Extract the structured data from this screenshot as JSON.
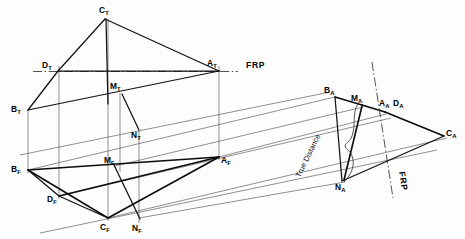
{
  "figure": {
    "background_color": "#fdfdfd",
    "line_color": "#111111",
    "projection_line_color": "#4a4a4a"
  },
  "reference_lines": [
    {
      "name": "frp-top",
      "label": "FRP",
      "label_x": 246,
      "label_y": 68,
      "x1": 33,
      "y1": 71.5,
      "x2": 238,
      "y2": 71.5
    },
    {
      "name": "frp-aux",
      "label": "FRP",
      "label_x": 399,
      "label_y": 172,
      "x1": 374,
      "y1": 64,
      "x2": 391,
      "y2": 196
    }
  ],
  "views": {
    "top": {
      "name": "top-view",
      "points": {
        "C_T": {
          "letter": "C",
          "sub": "T",
          "x": 105,
          "y": 19,
          "lx": 99,
          "ly": 13
        },
        "D_T": {
          "letter": "D",
          "sub": "T",
          "x": 58,
          "y": 71,
          "lx": 44,
          "ly": 67
        },
        "A_T": {
          "letter": "A",
          "sub": "T",
          "x": 219,
          "y": 71,
          "lx": 207,
          "ly": 65
        },
        "B_T": {
          "letter": "B",
          "sub": "T",
          "x": 28,
          "y": 110,
          "lx": 13,
          "ly": 111
        },
        "M_T": {
          "letter": "M",
          "sub": "T",
          "x": 122,
          "y": 93,
          "lx": 112,
          "ly": 88
        },
        "N_T": {
          "letter": "N",
          "sub": "T",
          "x": 138,
          "y": 133,
          "lx": 133,
          "ly": 137
        }
      }
    },
    "front": {
      "name": "front-view",
      "points": {
        "B_F": {
          "letter": "B",
          "sub": "F",
          "x": 28,
          "y": 170,
          "lx": 13,
          "ly": 171
        },
        "D_F": {
          "letter": "D",
          "sub": "F",
          "x": 59,
          "y": 196,
          "lx": 50,
          "ly": 200
        },
        "C_F": {
          "letter": "C",
          "sub": "F",
          "x": 108,
          "y": 218,
          "lx": 100,
          "ly": 228
        },
        "N_F": {
          "letter": "N",
          "sub": "F",
          "x": 138,
          "y": 221,
          "lx": 133,
          "ly": 230
        },
        "M_F": {
          "letter": "M",
          "sub": "F",
          "x": 115,
          "y": 166,
          "lx": 105,
          "ly": 162
        },
        "A_F": {
          "letter": "A",
          "sub": "F",
          "x": 219,
          "y": 157,
          "lx": 221,
          "ly": 162
        }
      }
    },
    "auxiliary": {
      "name": "auxiliary-view",
      "points": {
        "B_A": {
          "letter": "B",
          "sub": "A",
          "x": 335,
          "y": 97,
          "lx": 325,
          "ly": 92
        },
        "M_A": {
          "letter": "M",
          "sub": "A",
          "x": 362,
          "y": 105,
          "lx": 352,
          "ly": 100
        },
        "A_A": {
          "letter": "A",
          "sub": "A",
          "x": 385,
          "y": 112,
          "lx": 381,
          "ly": 105
        },
        "D_A": {
          "letter": "D",
          "sub": "A",
          "x": 385,
          "y": 112,
          "lx": 395,
          "ly": 105
        },
        "C_A": {
          "letter": "C",
          "sub": "A",
          "x": 444,
          "y": 136,
          "lx": 446,
          "ly": 134
        },
        "N_A": {
          "letter": "N",
          "sub": "A",
          "x": 342,
          "y": 181,
          "lx": 336,
          "ly": 189
        }
      },
      "annotation": {
        "name": "true-distance-annotation",
        "text": "True Distance",
        "x": 300,
        "y": 178,
        "rotation": -64
      }
    }
  },
  "geometry": {
    "top_view_edges": [
      {
        "name": "edge-CT-DT",
        "x1": 105,
        "y1": 19,
        "x2": 58,
        "y2": 71
      },
      {
        "name": "edge-CT-AT",
        "x1": 105,
        "y1": 19,
        "x2": 219,
        "y2": 71
      },
      {
        "name": "edge-CT-MT-ext",
        "x1": 105,
        "y1": 19,
        "x2": 108,
        "y2": 100
      },
      {
        "name": "edge-DT-BT",
        "x1": 58,
        "y1": 71,
        "x2": 28,
        "y2": 110
      },
      {
        "name": "edge-DT-AT",
        "x1": 58,
        "y1": 71,
        "x2": 219,
        "y2": 71
      },
      {
        "name": "edge-BT-AT",
        "x1": 28,
        "y1": 110,
        "x2": 219,
        "y2": 71
      },
      {
        "name": "edge-MT-NT",
        "x1": 122,
        "y1": 93,
        "x2": 139,
        "y2": 130
      }
    ],
    "front_view_edges": [
      {
        "name": "edge-BF-AF",
        "x1": 28,
        "y1": 170,
        "x2": 219,
        "y2": 157
      },
      {
        "name": "edge-BF-DF",
        "x1": 28,
        "y1": 170,
        "x2": 59,
        "y2": 196
      },
      {
        "name": "edge-DF-CF",
        "x1": 59,
        "y1": 196,
        "x2": 108,
        "y2": 218
      },
      {
        "name": "edge-CF-AF",
        "x1": 108,
        "y1": 218,
        "x2": 219,
        "y2": 157
      },
      {
        "name": "edge-BF-CF",
        "x1": 28,
        "y1": 170,
        "x2": 108,
        "y2": 218
      },
      {
        "name": "edge-DF-AF",
        "x1": 59,
        "y1": 196,
        "x2": 219,
        "y2": 157
      },
      {
        "name": "edge-MF-NF",
        "x1": 115,
        "y1": 166,
        "x2": 139,
        "y2": 218
      }
    ],
    "auxiliary_edges": [
      {
        "name": "edge-BA-MA",
        "x1": 335,
        "y1": 97,
        "x2": 362,
        "y2": 105
      },
      {
        "name": "edge-MA-AA",
        "x1": 362,
        "y1": 105,
        "x2": 385,
        "y2": 112
      },
      {
        "name": "edge-AA-CA",
        "x1": 385,
        "y1": 112,
        "x2": 444,
        "y2": 136
      },
      {
        "name": "edge-BA-NA",
        "x1": 335,
        "y1": 97,
        "x2": 342,
        "y2": 181
      },
      {
        "name": "edge-NA-CA",
        "x1": 342,
        "y1": 181,
        "x2": 444,
        "y2": 136
      },
      {
        "name": "edge-MA-NA",
        "x1": 362,
        "y1": 105,
        "x2": 344,
        "y2": 180
      }
    ],
    "top_to_front_verticals": [
      {
        "name": "vertical-B",
        "x": 28,
        "y1": 110,
        "y2": 172
      },
      {
        "name": "vertical-D",
        "x": 59,
        "y1": 66,
        "y2": 198
      },
      {
        "name": "vertical-C",
        "x": 108,
        "y1": 19,
        "y2": 220
      },
      {
        "name": "vertical-M",
        "x": 120,
        "y1": 93,
        "y2": 170
      },
      {
        "name": "vertical-N",
        "x": 139,
        "y1": 130,
        "y2": 222
      },
      {
        "name": "vertical-A",
        "x": 219,
        "y1": 66,
        "y2": 159
      }
    ],
    "front_to_aux_projectors": [
      {
        "name": "projector-B",
        "x1": 28,
        "y1": 170,
        "x2": 335,
        "y2": 97
      },
      {
        "name": "projector-M",
        "x1": 115,
        "y1": 166,
        "x2": 363,
        "y2": 107
      },
      {
        "name": "projector-A",
        "x1": 219,
        "y1": 157,
        "x2": 386,
        "y2": 114
      },
      {
        "name": "projector-D",
        "x1": 59,
        "y1": 196,
        "x2": 390,
        "y2": 118
      },
      {
        "name": "projector-N",
        "x1": 139,
        "y1": 218,
        "x2": 344,
        "y2": 182
      },
      {
        "name": "projector-C",
        "x1": 108,
        "y1": 218,
        "x2": 446,
        "y2": 138
      },
      {
        "name": "projector-lower",
        "x1": 50,
        "y1": 230,
        "x2": 434,
        "y2": 148
      }
    ]
  }
}
